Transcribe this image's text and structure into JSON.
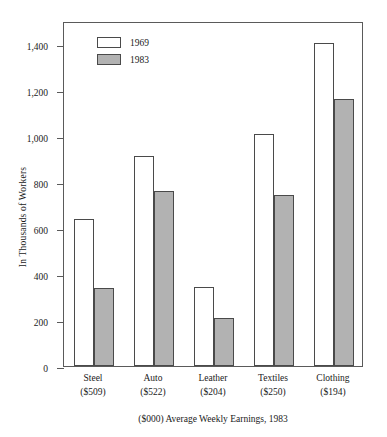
{
  "chart_data": {
    "type": "bar",
    "title": "",
    "subtitle": "",
    "xlabel": "($000) Average Weekly Earnings, 1983",
    "ylabel": "In Thousands of Workers",
    "categories": [
      "Steel",
      "Auto",
      "Leather",
      "Textiles",
      "Clothing"
    ],
    "category_sublabels": [
      "($509)",
      "($522)",
      "($204)",
      "($250)",
      "($194)"
    ],
    "series": [
      {
        "name": "1969",
        "color": "#ffffff",
        "values": [
          640,
          915,
          345,
          1010,
          1405
        ]
      },
      {
        "name": "1983",
        "color": "#b2b2b2",
        "values": [
          340,
          760,
          210,
          745,
          1160
        ]
      }
    ],
    "ylim": [
      0,
      1500
    ],
    "yticks": [
      0,
      200,
      400,
      600,
      800,
      1000,
      1200,
      1400
    ],
    "ytick_labels": [
      "0",
      "200",
      "400",
      "600",
      "800",
      "1,000",
      "1,200",
      "1,400"
    ],
    "grid": false,
    "legend_position": "top-left",
    "bar_outline_color": "#4a4a4a",
    "axis_color": "#5a5a5a"
  },
  "legend": {
    "items": [
      {
        "label": "1969"
      },
      {
        "label": "1983"
      }
    ]
  },
  "caption": "($000) Average Weekly Earnings, 1983"
}
